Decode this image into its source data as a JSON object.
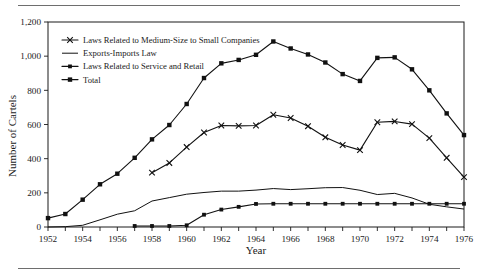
{
  "chart_data": {
    "type": "line",
    "title": "",
    "xlabel": "Year",
    "ylabel": "Number of Cartels",
    "xlim": [
      1952,
      1976
    ],
    "ylim": [
      0,
      1200
    ],
    "grid": false,
    "legend_position": "top-left",
    "x": [
      1952,
      1953,
      1954,
      1955,
      1956,
      1957,
      1958,
      1959,
      1960,
      1961,
      1962,
      1963,
      1964,
      1965,
      1966,
      1967,
      1968,
      1969,
      1970,
      1971,
      1972,
      1973,
      1974,
      1975,
      1976
    ],
    "x_tick_labels": [
      "1952",
      "1954",
      "1956",
      "1958",
      "1960",
      "1962",
      "1964",
      "1966",
      "1968",
      "1970",
      "1972",
      "1974",
      "1976"
    ],
    "y_tick_labels": [
      "0",
      "200",
      "400",
      "600",
      "800",
      "1,000",
      "1,200"
    ],
    "y_ticks": [
      0,
      200,
      400,
      600,
      800,
      1000,
      1200
    ],
    "series": [
      {
        "name": "Laws Related to Medium-Size to Small Companies",
        "marker": "x",
        "x": [
          1958,
          1959,
          1960,
          1961,
          1962,
          1963,
          1964,
          1965,
          1966,
          1967,
          1968,
          1969,
          1970,
          1971,
          1972,
          1973,
          1974,
          1975,
          1976
        ],
        "values": [
          318,
          375,
          468,
          553,
          594,
          592,
          594,
          657,
          638,
          590,
          525,
          480,
          450,
          613,
          618,
          602,
          520,
          405,
          292
        ]
      },
      {
        "name": "Exports-Imports Law",
        "marker": "none",
        "x": [
          1952,
          1953,
          1954,
          1955,
          1956,
          1957,
          1958,
          1959,
          1960,
          1961,
          1962,
          1963,
          1964,
          1965,
          1966,
          1967,
          1968,
          1969,
          1970,
          1971,
          1972,
          1973,
          1974,
          1975,
          1976
        ],
        "values": [
          0,
          2,
          10,
          42,
          75,
          95,
          152,
          172,
          192,
          202,
          210,
          210,
          216,
          225,
          219,
          224,
          230,
          231,
          215,
          190,
          197,
          170,
          133,
          118,
          105
        ]
      },
      {
        "name": "Laws Related to Service and Retail",
        "marker": "small-square",
        "x": [
          1957,
          1958,
          1959,
          1960,
          1961,
          1962,
          1963,
          1964,
          1965,
          1966,
          1967,
          1968,
          1969,
          1970,
          1971,
          1972,
          1973,
          1974,
          1975,
          1976
        ],
        "values": [
          6,
          6,
          6,
          10,
          72,
          102,
          118,
          135,
          136,
          136,
          136,
          136,
          136,
          136,
          136,
          136,
          136,
          136,
          136,
          136
        ]
      },
      {
        "name": "Total",
        "marker": "square",
        "x": [
          1952,
          1953,
          1954,
          1955,
          1956,
          1957,
          1958,
          1959,
          1960,
          1961,
          1962,
          1963,
          1964,
          1965,
          1966,
          1967,
          1968,
          1969,
          1970,
          1971,
          1972,
          1973,
          1974,
          1975,
          1976
        ],
        "values": [
          52,
          76,
          160,
          250,
          312,
          405,
          513,
          597,
          720,
          872,
          958,
          978,
          1008,
          1086,
          1045,
          1010,
          963,
          895,
          855,
          990,
          993,
          923,
          800,
          665,
          538
        ]
      }
    ],
    "legend": [
      "Laws Related to Medium-Size to Small Companies",
      "Exports-Imports Law",
      "Laws Related to Service and Retail",
      "Total"
    ],
    "colors": {
      "ink": "#111111",
      "rule": "#6e6e6e",
      "background": "#ffffff"
    }
  }
}
